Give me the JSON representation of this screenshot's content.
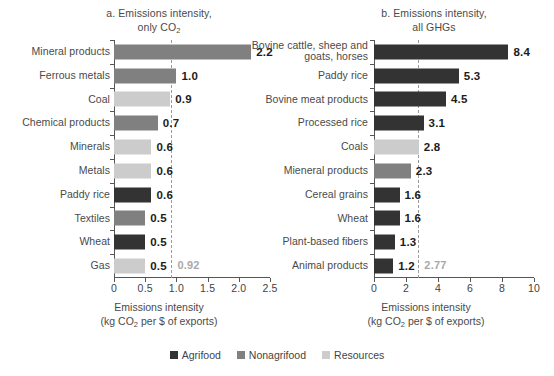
{
  "chart_data": [
    {
      "type": "bar",
      "orientation": "horizontal",
      "panel_label": "a.",
      "title": "a. Emissions intensity,",
      "subtitle": "only CO₂",
      "xlabel": "Emissions intensity",
      "xlabel_sub": "(kg CO₂ per $ of exports)",
      "ylabel": "",
      "xlim": [
        0,
        2.5
      ],
      "xticks": [
        0,
        0.5,
        1.0,
        1.5,
        2.0,
        2.5
      ],
      "xticklabels": [
        "0",
        "0.5",
        "1.0",
        "1.5",
        "2.0",
        "2.5"
      ],
      "grid": false,
      "reference_line": {
        "value": 0.92,
        "label": "0.92",
        "style": "dashed",
        "color": "#9a9a9a"
      },
      "categories": [
        "Mineral products",
        "Ferrous metals",
        "Coal",
        "Chemical products",
        "Minerals",
        "Metals",
        "Paddy rice",
        "Textiles",
        "Wheat",
        "Gas"
      ],
      "values": [
        2.2,
        1.0,
        0.9,
        0.7,
        0.6,
        0.6,
        0.6,
        0.5,
        0.5,
        0.5
      ],
      "value_labels": [
        "2.2",
        "1.0",
        "0.9",
        "0.7",
        "0.6",
        "0.6",
        "0.6",
        "0.5",
        "0.5",
        "0.5"
      ],
      "groups": [
        "nonagrifood",
        "nonagrifood",
        "resources",
        "nonagrifood",
        "resources",
        "resources",
        "agrifood",
        "nonagrifood",
        "agrifood",
        "resources"
      ]
    },
    {
      "type": "bar",
      "orientation": "horizontal",
      "panel_label": "b.",
      "title": "b. Emissions intensity,",
      "subtitle": "all GHGs",
      "xlabel": "Emissions intensity",
      "xlabel_sub": "(kg CO₂ per $ of exports)",
      "ylabel": "",
      "xlim": [
        0,
        10
      ],
      "xticks": [
        0,
        2,
        4,
        6,
        8,
        10
      ],
      "xticklabels": [
        "0",
        "2",
        "4",
        "6",
        "8",
        "10"
      ],
      "grid": false,
      "reference_line": {
        "value": 2.77,
        "label": "2.77",
        "style": "dashed",
        "color": "#9a9a9a"
      },
      "categories": [
        "Bovine cattle, sheep and\ngoats, horses",
        "Paddy rice",
        "Bovine meat products",
        "Processed rice",
        "Coals",
        "Mieneral products",
        "Cereal grains",
        "Wheat",
        "Plant-based fibers",
        "Animal products"
      ],
      "values": [
        8.4,
        5.3,
        4.5,
        3.1,
        2.8,
        2.3,
        1.6,
        1.6,
        1.3,
        1.2
      ],
      "value_labels": [
        "8.4",
        "5.3",
        "4.5",
        "3.1",
        "2.8",
        "2.3",
        "1.6",
        "1.6",
        "1.3",
        "1.2"
      ],
      "groups": [
        "agrifood",
        "agrifood",
        "agrifood",
        "agrifood",
        "resources",
        "nonagrifood",
        "agrifood",
        "agrifood",
        "agrifood",
        "agrifood"
      ]
    }
  ],
  "legend": {
    "position": "bottom-center",
    "items": [
      {
        "label": "Agrifood",
        "color": "#333333",
        "key": "agrifood"
      },
      {
        "label": "Nonagrifood",
        "color": "#808080",
        "key": "nonagrifood"
      },
      {
        "label": "Resources",
        "color": "#cccccc",
        "key": "resources"
      }
    ]
  }
}
